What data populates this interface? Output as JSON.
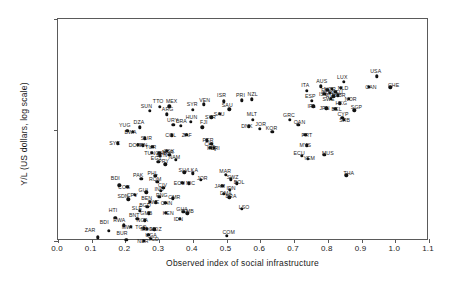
{
  "chart_data": {
    "type": "scatter",
    "title": "",
    "xlabel": "Observed index of social infrastructure",
    "ylabel": "Y/L (US dollars, log scale)",
    "xlim": [
      0.0,
      1.1
    ],
    "ylim": [
      1000,
      100000
    ],
    "yscale": "log",
    "grid": false,
    "legend": null,
    "xticks": [
      "0.0",
      "0.1",
      "0.2",
      "0.3",
      "0.4",
      "0.5",
      "0.6",
      "0.7",
      "0.8",
      "0.9",
      "1.0",
      "1.1"
    ],
    "xtick_values": [
      0.0,
      0.1,
      0.2,
      0.3,
      0.4,
      0.5,
      0.6,
      0.7,
      0.8,
      0.9,
      1.0,
      1.1
    ],
    "yticks": [
      "1,000",
      "10,000",
      "100,000"
    ],
    "ytick_values": [
      1000,
      10000,
      100000
    ],
    "marker": "filled-circle",
    "marker_color": "#111111",
    "points": [
      {
        "label": "ZAR",
        "x": 0.118,
        "y": 1080,
        "lx": 0.095,
        "ly": 1260
      },
      {
        "label": "BDI",
        "x": 0.15,
        "y": 1230,
        "lx": 0.137,
        "ly": 1470
      },
      {
        "label": "HTI",
        "x": 0.17,
        "y": 1620,
        "lx": 0.163,
        "ly": 1900
      },
      {
        "label": "RWA",
        "x": 0.195,
        "y": 1390,
        "lx": 0.182,
        "ly": 1560
      },
      {
        "label": "BUR",
        "x": 0.203,
        "y": 1020,
        "lx": 0.19,
        "ly": 1180
      },
      {
        "label": "MWI",
        "x": 0.215,
        "y": 1340,
        "lx": 0.205,
        "ly": 1340
      },
      {
        "label": "BDI",
        "x": 0.182,
        "y": 3180,
        "lx": 0.17,
        "ly": 3700
      },
      {
        "label": "SDN",
        "x": 0.208,
        "y": 2380,
        "lx": 0.193,
        "ly": 2560
      },
      {
        "label": "COG",
        "x": 0.205,
        "y": 3090,
        "lx": 0.196,
        "ly": 3090
      },
      {
        "label": "CPV",
        "x": 0.228,
        "y": 2620,
        "lx": 0.22,
        "ly": 2620
      },
      {
        "label": "PAK",
        "x": 0.247,
        "y": 3620,
        "lx": 0.238,
        "ly": 3900
      },
      {
        "label": "SLE",
        "x": 0.243,
        "y": 1880,
        "lx": 0.234,
        "ly": 2000
      },
      {
        "label": "BNT",
        "x": 0.235,
        "y": 1590,
        "lx": 0.226,
        "ly": 1700
      },
      {
        "label": "GUI",
        "x": 0.262,
        "y": 2740,
        "lx": 0.253,
        "ly": 2870
      },
      {
        "label": "BEN",
        "x": 0.272,
        "y": 2260,
        "lx": 0.263,
        "ly": 2420
      },
      {
        "label": "BGD",
        "x": 0.265,
        "y": 2040,
        "lx": 0.258,
        "ly": 2130
      },
      {
        "label": "GMB",
        "x": 0.27,
        "y": 1780,
        "lx": 0.262,
        "ly": 1780
      },
      {
        "label": "NGA",
        "x": 0.258,
        "y": 1530,
        "lx": 0.25,
        "ly": 1530
      },
      {
        "label": "TGO",
        "x": 0.254,
        "y": 1300,
        "lx": 0.246,
        "ly": 1330
      },
      {
        "label": "MDG",
        "x": 0.264,
        "y": 1290,
        "lx": 0.263,
        "ly": 1290
      },
      {
        "label": "MOZ",
        "x": 0.285,
        "y": 1270,
        "lx": 0.29,
        "ly": 1270
      },
      {
        "label": "UGA",
        "x": 0.268,
        "y": 1140,
        "lx": 0.276,
        "ly": 1140
      },
      {
        "label": "TCD",
        "x": 0.276,
        "y": 1040,
        "lx": 0.283,
        "ly": 1040
      },
      {
        "label": "NER",
        "x": 0.255,
        "y": 1010,
        "lx": 0.252,
        "ly": 1010
      },
      {
        "label": "ZWE",
        "x": 0.29,
        "y": 2240,
        "lx": 0.283,
        "ly": 2240
      },
      {
        "label": "PNG",
        "x": 0.3,
        "y": 2500,
        "lx": 0.308,
        "ly": 2600
      },
      {
        "label": "ROM",
        "x": 0.295,
        "y": 3400,
        "lx": 0.288,
        "ly": 3600
      },
      {
        "label": "PHL",
        "x": 0.288,
        "y": 3850,
        "lx": 0.281,
        "ly": 4100
      },
      {
        "label": "IND",
        "x": 0.305,
        "y": 2830,
        "lx": 0.3,
        "ly": 2950
      },
      {
        "label": "CIV",
        "x": 0.312,
        "y": 3020,
        "lx": 0.31,
        "ly": 3200
      },
      {
        "label": "CHN",
        "x": 0.318,
        "y": 2210,
        "lx": 0.322,
        "ly": 2210
      },
      {
        "label": "KEN",
        "x": 0.32,
        "y": 1800,
        "lx": 0.327,
        "ly": 1800
      },
      {
        "label": "CMR",
        "x": 0.34,
        "y": 2420,
        "lx": 0.345,
        "ly": 2480
      },
      {
        "label": "GHA",
        "x": 0.372,
        "y": 1840,
        "lx": 0.368,
        "ly": 1960
      },
      {
        "label": "GMB",
        "x": 0.383,
        "y": 1770,
        "lx": 0.385,
        "ly": 1870
      },
      {
        "label": "IDN",
        "x": 0.362,
        "y": 1580,
        "lx": 0.357,
        "ly": 1580
      },
      {
        "label": "EGY",
        "x": 0.297,
        "y": 5150,
        "lx": 0.292,
        "ly": 5550
      },
      {
        "label": "PRY",
        "x": 0.318,
        "y": 4900,
        "lx": 0.313,
        "ly": 5300
      },
      {
        "label": "NAM",
        "x": 0.35,
        "y": 5400,
        "lx": 0.345,
        "ly": 5700
      },
      {
        "label": "SLV",
        "x": 0.375,
        "y": 4150,
        "lx": 0.372,
        "ly": 4400
      },
      {
        "label": "LKA",
        "x": 0.4,
        "y": 4080,
        "lx": 0.4,
        "ly": 4350
      },
      {
        "label": "ECU",
        "x": 0.368,
        "y": 3350,
        "lx": 0.36,
        "ly": 3350
      },
      {
        "label": "NIC",
        "x": 0.388,
        "y": 3300,
        "lx": 0.393,
        "ly": 3300
      },
      {
        "label": "JOR",
        "x": 0.423,
        "y": 3550,
        "lx": 0.428,
        "ly": 3700
      },
      {
        "label": "SYC",
        "x": 0.178,
        "y": 7600,
        "lx": 0.168,
        "ly": 7600
      },
      {
        "label": "YUG",
        "x": 0.205,
        "y": 9850,
        "lx": 0.198,
        "ly": 11200
      },
      {
        "label": "DOM",
        "x": 0.237,
        "y": 7350,
        "lx": 0.228,
        "ly": 7350
      },
      {
        "label": "PAN",
        "x": 0.252,
        "y": 7280,
        "lx": 0.249,
        "ly": 7280
      },
      {
        "label": "DZA",
        "x": 0.243,
        "y": 10600,
        "lx": 0.24,
        "ly": 11800
      },
      {
        "label": "BWA",
        "x": 0.222,
        "y": 9600,
        "lx": 0.215,
        "ly": 9600
      },
      {
        "label": "SUR",
        "x": 0.258,
        "y": 8400,
        "lx": 0.262,
        "ly": 8400
      },
      {
        "label": "TUR",
        "x": 0.28,
        "y": 7100,
        "lx": 0.275,
        "ly": 7100
      },
      {
        "label": "TUN",
        "x": 0.278,
        "y": 6200,
        "lx": 0.272,
        "ly": 6200
      },
      {
        "label": "GAB",
        "x": 0.3,
        "y": 6250,
        "lx": 0.305,
        "ly": 6250
      },
      {
        "label": "BTN",
        "x": 0.302,
        "y": 5900,
        "lx": 0.308,
        "ly": 5900
      },
      {
        "label": "CSK",
        "x": 0.322,
        "y": 6500,
        "lx": 0.329,
        "ly": 6500
      },
      {
        "label": "MAR",
        "x": 0.33,
        "y": 5950,
        "lx": 0.326,
        "ly": 6300
      },
      {
        "label": "SUN",
        "x": 0.272,
        "y": 14800,
        "lx": 0.262,
        "ly": 16600
      },
      {
        "label": "TTO",
        "x": 0.302,
        "y": 16200,
        "lx": 0.297,
        "ly": 18200
      },
      {
        "label": "MEX",
        "x": 0.33,
        "y": 16400,
        "lx": 0.337,
        "ly": 18300
      },
      {
        "label": "ARG",
        "x": 0.322,
        "y": 13800,
        "lx": 0.325,
        "ly": 15300
      },
      {
        "label": "URY",
        "x": 0.342,
        "y": 11200,
        "lx": 0.34,
        "ly": 12400
      },
      {
        "label": "COL",
        "x": 0.337,
        "y": 8950,
        "lx": 0.334,
        "ly": 8950
      },
      {
        "label": "BRA",
        "x": 0.365,
        "y": 10900,
        "lx": 0.366,
        "ly": 12000
      },
      {
        "label": "HUN",
        "x": 0.393,
        "y": 11900,
        "lx": 0.396,
        "ly": 13200
      },
      {
        "label": "ZAF",
        "x": 0.38,
        "y": 9000,
        "lx": 0.382,
        "ly": 9000
      },
      {
        "label": "SYR",
        "x": 0.4,
        "y": 15200,
        "lx": 0.398,
        "ly": 17000
      },
      {
        "label": "VEN",
        "x": 0.432,
        "y": 17000,
        "lx": 0.435,
        "ly": 18800
      },
      {
        "label": "FJI",
        "x": 0.428,
        "y": 10600,
        "lx": 0.432,
        "ly": 11700
      },
      {
        "label": "PER",
        "x": 0.442,
        "y": 8100,
        "lx": 0.445,
        "ly": 8100
      },
      {
        "label": "IRQ",
        "x": 0.452,
        "y": 6900,
        "lx": 0.456,
        "ly": 6900
      },
      {
        "label": "MAR",
        "x": 0.498,
        "y": 3950,
        "lx": 0.496,
        "ly": 4250
      },
      {
        "label": "SWZ",
        "x": 0.513,
        "y": 3600,
        "lx": 0.518,
        "ly": 3750
      },
      {
        "label": "BOL",
        "x": 0.53,
        "y": 3320,
        "lx": 0.537,
        "ly": 3400
      },
      {
        "label": "JAM",
        "x": 0.487,
        "y": 3150,
        "lx": 0.48,
        "ly": 3150
      },
      {
        "label": "IDN",
        "x": 0.51,
        "y": 2900,
        "lx": 0.513,
        "ly": 2980
      },
      {
        "label": "DMA",
        "x": 0.492,
        "y": 2660,
        "lx": 0.498,
        "ly": 2720
      },
      {
        "label": "BRA",
        "x": 0.508,
        "y": 2480,
        "lx": 0.513,
        "ly": 2560
      },
      {
        "label": "LSO",
        "x": 0.545,
        "y": 1940,
        "lx": 0.552,
        "ly": 2040
      },
      {
        "label": "COM",
        "x": 0.5,
        "y": 1110,
        "lx": 0.506,
        "ly": 1200
      },
      {
        "label": "CHL",
        "x": 0.455,
        "y": 7550,
        "lx": 0.45,
        "ly": 7550
      },
      {
        "label": "CRI",
        "x": 0.462,
        "y": 6950,
        "lx": 0.466,
        "ly": 6950
      },
      {
        "label": "ISR",
        "x": 0.492,
        "y": 18200,
        "lx": 0.485,
        "ly": 20500
      },
      {
        "label": "SAU",
        "x": 0.508,
        "y": 15400,
        "lx": 0.502,
        "ly": 16900
      },
      {
        "label": "PRI",
        "x": 0.545,
        "y": 18500,
        "lx": 0.541,
        "ly": 20600
      },
      {
        "label": "NZL",
        "x": 0.575,
        "y": 18900,
        "lx": 0.577,
        "ly": 21000
      },
      {
        "label": "MLT",
        "x": 0.578,
        "y": 12400,
        "lx": 0.575,
        "ly": 13800
      },
      {
        "label": "DNK",
        "x": 0.565,
        "y": 10800,
        "lx": 0.56,
        "ly": 10800
      },
      {
        "label": "JOR",
        "x": 0.598,
        "y": 10300,
        "lx": 0.601,
        "ly": 11300
      },
      {
        "label": "KOR",
        "x": 0.635,
        "y": 9650,
        "lx": 0.633,
        "ly": 10450
      },
      {
        "label": "GRC",
        "x": 0.688,
        "y": 12300,
        "lx": 0.685,
        "ly": 13700
      },
      {
        "label": "OAN",
        "x": 0.712,
        "y": 11100,
        "lx": 0.716,
        "ly": 11900
      },
      {
        "label": "PRT",
        "x": 0.733,
        "y": 9100,
        "lx": 0.738,
        "ly": 9100
      },
      {
        "label": "MYS",
        "x": 0.738,
        "y": 7300,
        "lx": 0.733,
        "ly": 7300
      },
      {
        "label": "ECU",
        "x": 0.722,
        "y": 5850,
        "lx": 0.715,
        "ly": 6200
      },
      {
        "label": "YEM",
        "x": 0.74,
        "y": 5500,
        "lx": 0.745,
        "ly": 5550
      },
      {
        "label": "MUS",
        "x": 0.79,
        "y": 6000,
        "lx": 0.8,
        "ly": 6200
      },
      {
        "label": "THA",
        "x": 0.855,
        "y": 3900,
        "lx": 0.862,
        "ly": 4100
      },
      {
        "label": "ITA",
        "x": 0.738,
        "y": 22500,
        "lx": 0.733,
        "ly": 25200
      },
      {
        "label": "AUS",
        "x": 0.78,
        "y": 24800,
        "lx": 0.782,
        "ly": 27800
      },
      {
        "label": "ESP",
        "x": 0.752,
        "y": 18400,
        "lx": 0.748,
        "ly": 20400
      },
      {
        "label": "IRL",
        "x": 0.757,
        "y": 16300,
        "lx": 0.752,
        "ly": 16300
      },
      {
        "label": "JPN",
        "x": 0.795,
        "y": 15700,
        "lx": 0.79,
        "ly": 15700
      },
      {
        "label": "CYP",
        "x": 0.843,
        "y": 12900,
        "lx": 0.845,
        "ly": 13900
      },
      {
        "label": "SRB",
        "x": 0.848,
        "y": 12300,
        "lx": 0.85,
        "ly": 12300
      },
      {
        "label": "BEL",
        "x": 0.822,
        "y": 15500,
        "lx": 0.826,
        "ly": 15500
      },
      {
        "label": "SGP",
        "x": 0.878,
        "y": 15100,
        "lx": 0.885,
        "ly": 16000
      },
      {
        "label": "LUX",
        "x": 0.848,
        "y": 27200,
        "lx": 0.843,
        "ly": 29800
      },
      {
        "label": "USA",
        "x": 0.945,
        "y": 30500,
        "lx": 0.942,
        "ly": 34000
      },
      {
        "label": "CHE",
        "x": 0.985,
        "y": 24200,
        "lx": 0.995,
        "ly": 25200
      },
      {
        "label": "NLD",
        "x": 0.838,
        "y": 24000,
        "lx": 0.845,
        "ly": 24000
      },
      {
        "label": "CAN",
        "x": 0.922,
        "y": 24500,
        "lx": 0.928,
        "ly": 24500
      },
      {
        "label": "NOR",
        "x": 0.812,
        "y": 23400,
        "lx": 0.806,
        "ly": 23400
      },
      {
        "label": "DEU",
        "x": 0.822,
        "y": 22100,
        "lx": 0.828,
        "ly": 22100
      },
      {
        "label": "FRA",
        "x": 0.805,
        "y": 21600,
        "lx": 0.8,
        "ly": 21600
      },
      {
        "label": "GBR",
        "x": 0.83,
        "y": 20600,
        "lx": 0.836,
        "ly": 20600
      },
      {
        "label": "AUT",
        "x": 0.816,
        "y": 20100,
        "lx": 0.81,
        "ly": 20100
      },
      {
        "label": "SWE",
        "x": 0.808,
        "y": 19100,
        "lx": 0.802,
        "ly": 19100
      },
      {
        "label": "FIN",
        "x": 0.798,
        "y": 22900,
        "lx": 0.793,
        "ly": 22900
      },
      {
        "label": "ISL",
        "x": 0.79,
        "y": 21200,
        "lx": 0.786,
        "ly": 21200
      },
      {
        "label": "HKG",
        "x": 0.835,
        "y": 17400,
        "lx": 0.84,
        "ly": 17400
      },
      {
        "label": "NOR",
        "x": 0.862,
        "y": 19200,
        "lx": 0.868,
        "ly": 19200
      },
      {
        "label": "SAU",
        "x": 0.48,
        "y": 14000,
        "lx": 0.478,
        "ly": 14000
      },
      {
        "label": "SYR",
        "x": 0.455,
        "y": 13000,
        "lx": 0.452,
        "ly": 13000
      }
    ]
  }
}
